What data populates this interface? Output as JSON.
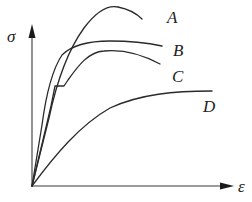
{
  "diagram": {
    "type": "stress-strain curves",
    "axes": {
      "y_label": "σ",
      "x_label": "ε"
    },
    "curves": [
      {
        "id": "A",
        "label": "A",
        "description": "high strength, steep rise, peak then drop"
      },
      {
        "id": "B",
        "label": "B",
        "description": "steep rise, gradual flattening, slight decline"
      },
      {
        "id": "C",
        "label": "C",
        "description": "linear rise, yield plateau, strain hardening, then necking"
      },
      {
        "id": "D",
        "label": "D",
        "description": "low modulus, gradual curved rise"
      }
    ],
    "stroke_color": "#2a2a2a",
    "background": "#ffffff"
  }
}
